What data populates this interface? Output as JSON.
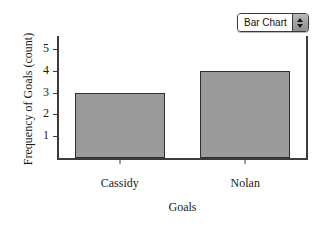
{
  "control": {
    "name": "chart-type-selector",
    "value": "Bar Chart",
    "stepper_up_icon": "triangle-up-icon",
    "stepper_down_icon": "triangle-down-icon"
  },
  "chart_data": {
    "type": "bar",
    "title": "",
    "xlabel": "Goals",
    "ylabel": "Frequency of Goals (count)",
    "categories": [
      "Cassidy",
      "Nolan"
    ],
    "values": [
      3,
      4
    ],
    "ylim": [
      0,
      5.6
    ],
    "yticks": [
      1,
      2,
      3,
      4,
      5
    ],
    "ytick_labels": [
      "1",
      "2",
      "3",
      "4",
      "5"
    ],
    "grid": false,
    "legend": false,
    "bar_color": "#9b9b9b",
    "bar_edge_color": "#2f2f2f",
    "axis_color": "#3c3c3c",
    "background": "#ffffff"
  }
}
